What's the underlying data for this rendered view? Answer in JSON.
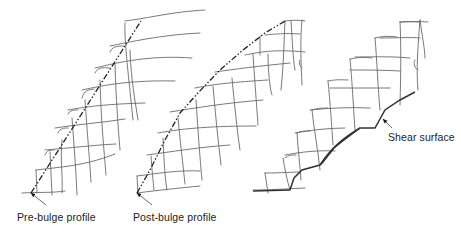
{
  "figure": {
    "panels": [
      {
        "id": "pre-bulge",
        "label": "Pre-bulge profile",
        "label_pos": [
          17,
          211
        ],
        "arrow": {
          "from": [
            46,
            205
          ],
          "to": [
            31,
            193
          ]
        },
        "profile": [
          [
            31,
            193
          ],
          [
            141,
            21
          ]
        ]
      },
      {
        "id": "post-bulge",
        "label": "Post-bulge profile",
        "label_pos": [
          133,
          211
        ],
        "arrow": {
          "from": [
            152,
            205
          ],
          "to": [
            137,
            193
          ]
        },
        "profile": [
          [
            137,
            193
          ],
          [
            150,
            170
          ],
          [
            165,
            140
          ],
          [
            180,
            113
          ],
          [
            198,
            93
          ],
          [
            220,
            70
          ],
          [
            243,
            50
          ],
          [
            265,
            33
          ],
          [
            285,
            21
          ]
        ]
      },
      {
        "id": "shear",
        "label": "Shear surface",
        "label_pos": [
          388,
          131
        ],
        "arrow": {
          "from": [
            392,
            128
          ],
          "to": [
            383,
            119
          ]
        },
        "shear_line": [
          [
            290,
            190
          ],
          [
            294,
            178
          ],
          [
            302,
            170
          ],
          [
            320,
            165
          ],
          [
            323,
            162
          ],
          [
            334,
            148
          ],
          [
            344,
            140
          ],
          [
            360,
            128
          ],
          [
            375,
            128
          ],
          [
            385,
            110
          ],
          [
            400,
            100
          ],
          [
            415,
            92
          ]
        ]
      }
    ]
  }
}
